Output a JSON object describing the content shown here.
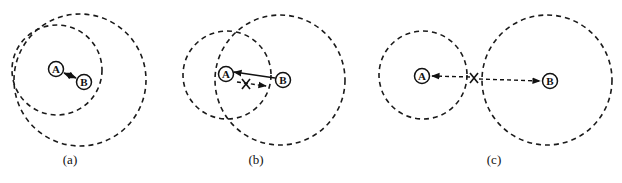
{
  "figure": {
    "panels": [
      {
        "id": "a",
        "caption": "(a)",
        "description": "A and B within each other's range; bidirectional link",
        "nodes": [
          {
            "label": "A",
            "x": 56,
            "y": 69
          },
          {
            "label": "B",
            "x": 84,
            "y": 82
          }
        ],
        "ranges": [
          {
            "of": "A",
            "cx": 57,
            "cy": 70,
            "r": 45
          },
          {
            "of": "B",
            "cx": 80,
            "cy": 80,
            "r": 66
          }
        ],
        "links": [
          {
            "from": "A",
            "to": "B",
            "style": "solid",
            "direction": "bidirectional"
          }
        ]
      },
      {
        "id": "b",
        "caption": "(b)",
        "description": "B reaches A but A cannot reach B; unidirectional link",
        "nodes": [
          {
            "label": "A",
            "x": 226,
            "y": 74
          },
          {
            "label": "B",
            "x": 283,
            "y": 80
          }
        ],
        "ranges": [
          {
            "of": "A",
            "cx": 227,
            "cy": 75,
            "r": 44
          },
          {
            "of": "B",
            "cx": 280,
            "cy": 80,
            "r": 65
          }
        ],
        "links": [
          {
            "from": "B",
            "to": "A",
            "style": "solid",
            "direction": "one-way"
          },
          {
            "from": "A",
            "to": "B",
            "style": "dashed",
            "direction": "blocked",
            "x_mark": true
          }
        ]
      },
      {
        "id": "c",
        "caption": "(c)",
        "description": "A and B out of each other's range; no link",
        "nodes": [
          {
            "label": "A",
            "x": 422,
            "y": 76
          },
          {
            "label": "B",
            "x": 550,
            "y": 81
          }
        ],
        "ranges": [
          {
            "of": "A",
            "cx": 423,
            "cy": 75,
            "r": 44
          },
          {
            "of": "B",
            "cx": 547,
            "cy": 80,
            "r": 65
          }
        ],
        "links": [
          {
            "from": "X",
            "to": "A",
            "style": "dashed",
            "direction": "blocked",
            "x_mark": true
          },
          {
            "from": "X",
            "to": "B",
            "style": "dashed",
            "direction": "blocked",
            "x_mark": true
          }
        ]
      }
    ],
    "colors": {
      "stroke": "#111111",
      "background": "#ffffff"
    }
  }
}
